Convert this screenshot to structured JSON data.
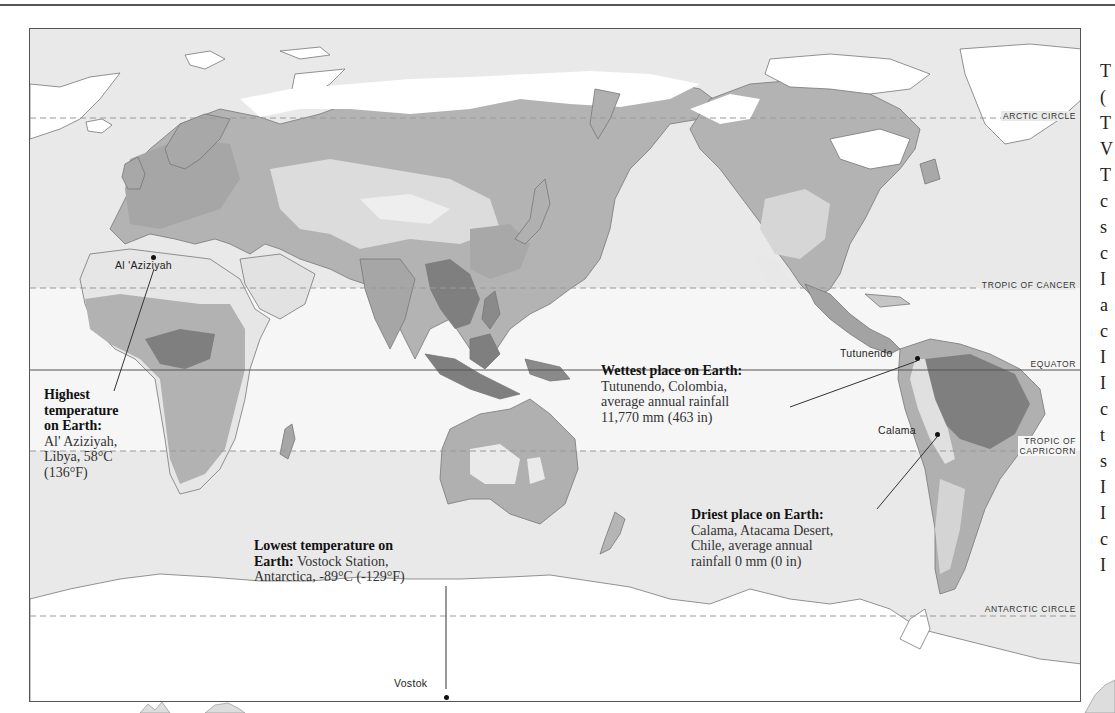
{
  "map": {
    "title": "World climate extremes map",
    "latitude_lines": [
      {
        "id": "arctic",
        "label": "ARCTIC CIRCLE",
        "style": "dashed"
      },
      {
        "id": "cancer",
        "label": "TROPIC OF CANCER",
        "style": "dashed"
      },
      {
        "id": "equator",
        "label": "EQUATOR",
        "style": "solid"
      },
      {
        "id": "capricorn",
        "label_line1": "TROPIC OF",
        "label_line2": "CAPRICORN",
        "style": "dashed"
      },
      {
        "id": "antarctic",
        "label": "ANTARCTIC CIRCLE",
        "style": "dashed"
      }
    ],
    "places": {
      "aziziyah": "Al 'Aziziyah",
      "tutunendo": "Tutunendo",
      "calama": "Calama",
      "vostok": "Vostok"
    },
    "callouts": {
      "highest_temp": {
        "heading_line1": "Highest",
        "heading_line2": "temperature",
        "heading_line3": "on Earth:",
        "body_line1": "Al' Aziziyah,",
        "body_line2": "Libya, 58°C",
        "body_line3": "(136°F)"
      },
      "wettest": {
        "heading": "Wettest place on Earth:",
        "body_line1": "Tutunendo, Colombia,",
        "body_line2": "average annual rainfall",
        "body_line3": "11,770 mm (463 in)"
      },
      "driest": {
        "heading": "Driest place on Earth:",
        "body_line1": "Calama, Atacama Desert,",
        "body_line2": "Chile, average annual",
        "body_line3": "rainfall 0 mm (0 in)"
      },
      "lowest_temp": {
        "heading_line1": "Lowest temperature on",
        "heading_line2": "Earth:",
        "body_line2": " Vostock Station,",
        "body_line3": "Antarctica, -89°C (-129°F)"
      }
    },
    "colors": {
      "ocean": "#e9e9e9",
      "tropic_band": "#f6f6f6",
      "ice": "#ffffff",
      "dry": "#dcdcdc",
      "moderate": "#b9b9b9",
      "wet": "#a3a3a3",
      "very_wet": "#7f7f7f"
    }
  },
  "right_column_fragments": [
    "T",
    "(",
    "T",
    "V",
    "T",
    "c",
    "s",
    "c",
    "I",
    "a",
    "c",
    "I",
    "I",
    "c",
    "t",
    "s",
    "I",
    "I",
    "c",
    "I"
  ]
}
